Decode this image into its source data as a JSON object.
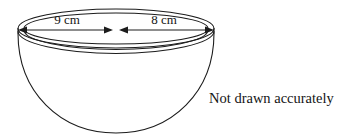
{
  "figure": {
    "type": "geometry-diagram",
    "ink_color": "#1c1c1c",
    "background_color": "#ffffff",
    "fill": "none",
    "dimensions": [
      {
        "id": "left-radius",
        "label": "9 cm",
        "description": "left half of rim diameter, double-headed arrow from left rim edge to centre"
      },
      {
        "id": "right-radius",
        "label": "8 cm",
        "description": "right half of rim diameter, double-headed arrow from centre to right rim edge"
      }
    ],
    "note": "Not drawn accurately"
  }
}
